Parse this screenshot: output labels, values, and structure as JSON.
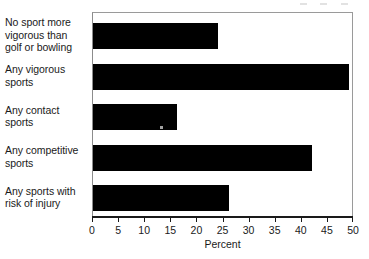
{
  "chart_data": {
    "type": "bar",
    "orientation": "horizontal",
    "title": "",
    "xlabel": "Percent",
    "ylabel": "",
    "xlim": [
      0,
      50
    ],
    "xticks": [
      0,
      5,
      10,
      15,
      20,
      25,
      30,
      35,
      40,
      45,
      50
    ],
    "grid": false,
    "legend": null,
    "bar_color": "#000000",
    "frame_color": "#8c8c8c",
    "categories": [
      "No sport more vigorous than golf or bowling",
      "Any vigorous sports",
      "Any contact sports",
      "Any competitive sports",
      "Any sports with risk of injury"
    ],
    "category_lines": [
      [
        "No sport more",
        "vigorous than",
        "golf or bowling"
      ],
      [
        "Any vigorous",
        "sports"
      ],
      [
        "Any contact",
        "sports"
      ],
      [
        "Any competitive",
        "sports"
      ],
      [
        "Any sports with",
        "risk of injury"
      ]
    ],
    "values": [
      24,
      49,
      16,
      42,
      26
    ]
  }
}
